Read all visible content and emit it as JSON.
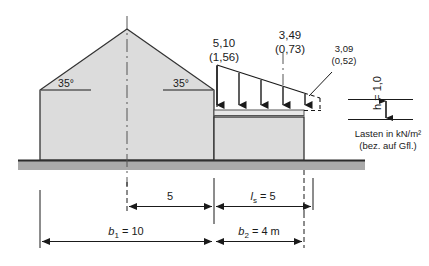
{
  "figure": {
    "colors": {
      "wall_fill": "#dcdcdc",
      "outline": "#333333",
      "ground_band": "#aaaaaa",
      "ground_line": "#2b2b2b",
      "text": "#1a1a1a",
      "centerline": "#555555"
    }
  },
  "angles": {
    "left_label": "35°",
    "right_label": "35°"
  },
  "loads": {
    "peak": {
      "value": "5,10",
      "bracket": "(1,56)"
    },
    "mid": {
      "value": "3,49",
      "bracket": "(0,73)"
    },
    "edge": {
      "value": "3,09",
      "bracket": "(0,52)"
    },
    "arrow_count": 5
  },
  "height_marker": {
    "label": "h = 1,0",
    "label_plain": "h",
    "label_value": "= 1,0"
  },
  "legend": {
    "line1": "Lasten in kN/m²",
    "line2": "(bez. auf Gfl.)"
  },
  "dimensions": {
    "upper": [
      {
        "name": "half-main-span",
        "label": "5",
        "italic": false
      },
      {
        "name": "drift-length",
        "label": "l",
        "sub": "s",
        "suffix": " = 5",
        "italic": true
      }
    ],
    "lower": [
      {
        "name": "main-building-width",
        "label": "b",
        "sub": "1",
        "suffix": " = 10",
        "italic": true
      },
      {
        "name": "annex-width",
        "label": "b",
        "sub": "2",
        "suffix": " = 4 m",
        "italic": true
      }
    ]
  }
}
